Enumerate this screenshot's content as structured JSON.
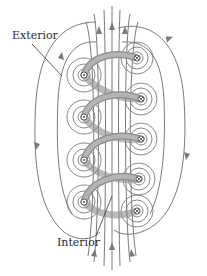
{
  "figure": {
    "labels": {
      "exterior": "Exterior",
      "interior": "Interior"
    },
    "colors": {
      "field_line": "#7a7a7a",
      "coil": "#a8a8a8",
      "coil_edge": "#8c8c8c",
      "label_text": "#2a2a2a",
      "wire_symbol": "#555555"
    },
    "coil": {
      "turns": 5,
      "left_wire_symbols": [
        {
          "x": 84,
          "y": 75,
          "symbol": "dot"
        },
        {
          "x": 84,
          "y": 117,
          "symbol": "dot"
        },
        {
          "x": 84,
          "y": 160,
          "symbol": "dot"
        },
        {
          "x": 84,
          "y": 202,
          "symbol": "dot"
        }
      ],
      "right_wire_symbols": [
        {
          "x": 137,
          "y": 58,
          "symbol": "cross"
        },
        {
          "x": 141,
          "y": 99,
          "symbol": "cross"
        },
        {
          "x": 141,
          "y": 139,
          "symbol": "cross"
        },
        {
          "x": 139,
          "y": 179,
          "symbol": "cross"
        },
        {
          "x": 137,
          "y": 211,
          "symbol": "cross"
        }
      ]
    }
  }
}
